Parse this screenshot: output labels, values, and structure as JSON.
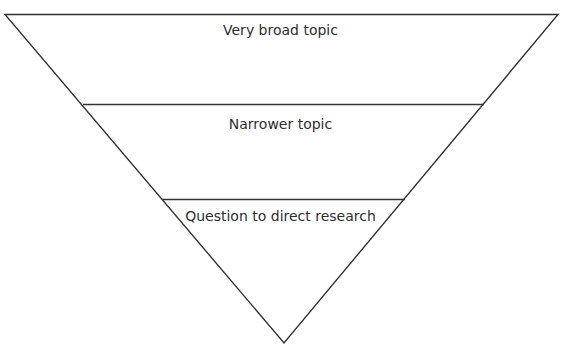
{
  "diagram": {
    "type": "inverted-pyramid",
    "line_color": "#333333",
    "text_color": "#2e2e2e",
    "background": "#ffffff",
    "levels": [
      {
        "label": "Very broad topic"
      },
      {
        "label": "Narrower topic"
      },
      {
        "label": "Question to direct research"
      }
    ]
  }
}
